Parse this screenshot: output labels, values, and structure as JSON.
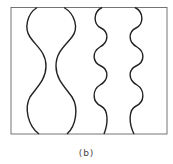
{
  "figure": {
    "caption": "(b)",
    "frame": {
      "x": 11,
      "y": 7,
      "width": 156,
      "height": 127,
      "stroke": "#555555"
    },
    "curve_color": "#222222",
    "left_pair": {
      "description": "two wide bulges top and bottom with a single narrow neck in the middle",
      "bulges": 2
    },
    "right_pair": {
      "description": "wavy channel with four alternating bulges",
      "bulges": 4
    }
  }
}
